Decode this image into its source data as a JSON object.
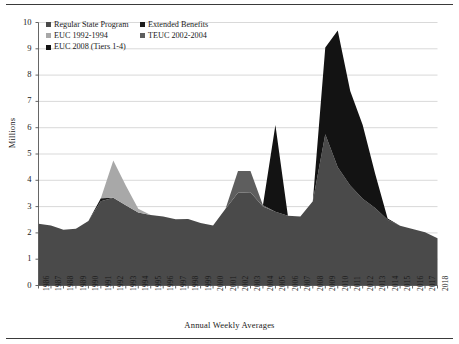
{
  "chart_data": {
    "type": "area",
    "stacked": true,
    "title": "",
    "xlabel": "Annual Weekly Averages",
    "ylabel": "Millions",
    "ylim": [
      0,
      10
    ],
    "yticks": [
      0,
      1,
      2,
      3,
      4,
      5,
      6,
      7,
      8,
      9,
      10
    ],
    "grid": true,
    "legend_position": "top-left inside plot",
    "categories": [
      "1986",
      "1987",
      "1988",
      "1989",
      "1990",
      "1991",
      "1992",
      "1993",
      "1994",
      "1995",
      "1996",
      "1997",
      "1998",
      "1999",
      "2000",
      "2001",
      "2002",
      "2003",
      "2004",
      "2005",
      "2006",
      "2007",
      "2008",
      "2009",
      "2010",
      "2011",
      "2012",
      "2013",
      "2014",
      "2015",
      "2016",
      "2017",
      "2018"
    ],
    "series": [
      {
        "name": "Regular State Program",
        "color": "#4a4a4a",
        "values": [
          2.35,
          2.28,
          2.12,
          2.16,
          2.45,
          3.2,
          3.34,
          3.05,
          2.78,
          2.68,
          2.62,
          2.52,
          2.53,
          2.38,
          2.28,
          2.92,
          3.53,
          3.55,
          3.0,
          2.8,
          2.65,
          2.62,
          3.2,
          5.75,
          4.5,
          3.8,
          3.3,
          2.95,
          2.5,
          2.27,
          2.15,
          2.02,
          1.8
        ]
      },
      {
        "name": "Extended Benefits",
        "color": "#1c1c1c",
        "values": [
          0.0,
          0.0,
          0.0,
          0.0,
          0.0,
          0.12,
          0.0,
          0.0,
          0.0,
          0.0,
          0.0,
          0.0,
          0.0,
          0.0,
          0.0,
          0.0,
          0.0,
          0.0,
          0.0,
          0.0,
          0.0,
          0.0,
          0.0,
          0.0,
          0.0,
          0.0,
          0.0,
          0.0,
          0.0,
          0.0,
          0.0,
          0.0,
          0.0
        ]
      },
      {
        "name": "EUC 1992-1994",
        "color": "#a8a8a8",
        "values": [
          0.0,
          0.0,
          0.0,
          0.0,
          0.0,
          0.0,
          1.41,
          0.75,
          0.14,
          0.0,
          0.0,
          0.0,
          0.0,
          0.0,
          0.0,
          0.0,
          0.0,
          0.0,
          0.0,
          0.0,
          0.0,
          0.0,
          0.0,
          0.0,
          0.0,
          0.0,
          0.0,
          0.0,
          0.0,
          0.0,
          0.0,
          0.0,
          0.0
        ]
      },
      {
        "name": "TEUC 2002-2004",
        "color": "#5e5e5e",
        "values": [
          0.0,
          0.0,
          0.0,
          0.0,
          0.0,
          0.0,
          0.0,
          0.0,
          0.0,
          0.0,
          0.0,
          0.0,
          0.0,
          0.0,
          0.0,
          0.0,
          0.82,
          0.8,
          0.05,
          0.0,
          0.0,
          0.0,
          0.0,
          0.0,
          0.0,
          0.0,
          0.0,
          0.0,
          0.0,
          0.0,
          0.0,
          0.0,
          0.0
        ]
      },
      {
        "name": "EUC 2008 (Tiers 1-4)",
        "color": "#131313",
        "values": [
          0.0,
          0.0,
          0.0,
          0.0,
          0.0,
          0.0,
          0.0,
          0.0,
          0.0,
          0.0,
          0.0,
          0.0,
          0.0,
          0.0,
          0.0,
          0.0,
          0.0,
          0.0,
          0.0,
          3.3,
          0.0,
          0.0,
          0.0,
          3.3,
          5.2,
          3.6,
          2.8,
          1.3,
          0.05,
          0.0,
          0.0,
          0.0,
          0.0
        ]
      }
    ],
    "stack_totals": [
      2.35,
      2.28,
      2.12,
      2.16,
      2.45,
      3.32,
      4.75,
      3.8,
      2.92,
      2.68,
      2.62,
      2.52,
      2.53,
      2.38,
      2.28,
      2.92,
      4.35,
      4.35,
      3.05,
      2.8,
      2.65,
      2.62,
      3.2,
      9.05,
      9.7,
      7.4,
      6.1,
      4.25,
      2.55,
      2.27,
      2.15,
      2.02,
      1.8
    ],
    "annotations": []
  },
  "legend": {
    "entries": [
      {
        "label": "Regular State Program",
        "color": "#4a4a4a"
      },
      {
        "label": "Extended Benefits",
        "color": "#1c1c1c"
      },
      {
        "label": "EUC 1992-1994",
        "color": "#a8a8a8"
      },
      {
        "label": "TEUC 2002-2004",
        "color": "#5e5e5e"
      },
      {
        "label": "EUC 2008 (Tiers 1-4)",
        "color": "#131313"
      }
    ]
  },
  "axes": {
    "y_title": "Millions",
    "x_title": "Annual Weekly Averages"
  },
  "style": {
    "background": "#ffffff",
    "grid_color": "#c9c9c9",
    "axis_color": "#555555",
    "text_color": "#1a1a1a"
  }
}
